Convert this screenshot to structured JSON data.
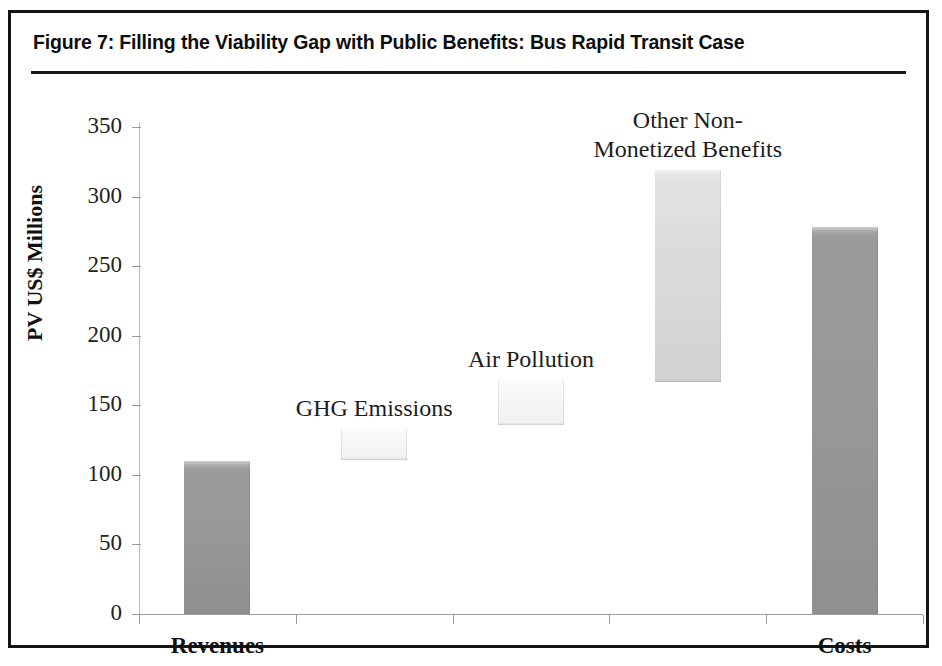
{
  "figure": {
    "title": "Figure 7: Filling the Viability Gap with Public Benefits: Bus Rapid Transit Case"
  },
  "chart_data": {
    "type": "bar",
    "subtype": "waterfall",
    "title": "Figure 7: Filling the Viability Gap with Public Benefits: Bus Rapid Transit Case",
    "xlabel": "",
    "ylabel": "PV US$ Millions",
    "ylim": [
      0,
      350
    ],
    "yticks": [
      0,
      50,
      100,
      150,
      200,
      250,
      300,
      350
    ],
    "ytick_labels": [
      "0",
      "50",
      "100",
      "150",
      "200",
      "250",
      "300",
      "350"
    ],
    "grid": false,
    "legend": false,
    "categories": [
      "Revenues",
      "GHG Emissions",
      "Air Pollution",
      "Other Non-Monetized Benefits",
      "Costs"
    ],
    "axis_tick_labels": [
      "Revenues",
      "",
      "",
      "",
      "Costs"
    ],
    "bars": [
      {
        "label": "Revenues",
        "base": 0,
        "top": 110,
        "value": 110,
        "shade": "dark",
        "annotation": "",
        "axis_label": "Revenues"
      },
      {
        "label": "GHG Emissions",
        "base": 111,
        "top": 133,
        "value": 22,
        "shade": "vlight",
        "annotation": "GHG Emissions",
        "axis_label": ""
      },
      {
        "label": "Air Pollution",
        "base": 136,
        "top": 168,
        "value": 32,
        "shade": "vlight",
        "annotation": "Air Pollution",
        "axis_label": ""
      },
      {
        "label": "Other Non-Monetized Benefits",
        "base": 167,
        "top": 319,
        "value": 152,
        "shade": "light",
        "annotation": "Other  Non-\nMonetized Benefits",
        "axis_label": ""
      },
      {
        "label": "Costs",
        "base": 0,
        "top": 278,
        "value": 278,
        "shade": "dark",
        "annotation": "",
        "axis_label": "Costs"
      }
    ],
    "colors": {
      "bar_dark": "#989898",
      "bar_light": "#dcdcdc",
      "bar_very_light": "#f6f6f6",
      "axis": "#9a9a9a",
      "text": "#111111",
      "frame": "#141414"
    }
  }
}
